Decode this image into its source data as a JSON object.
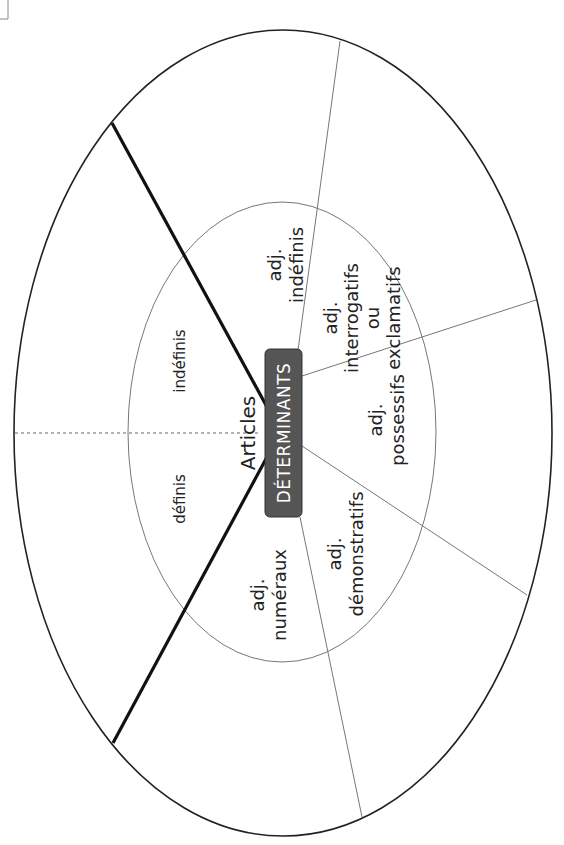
{
  "diagram": {
    "center": {
      "label": "DÉTERMINANTS",
      "fill": "#555555",
      "text_color": "#ffffff"
    },
    "articles": {
      "title": "Articles",
      "definis": "définis",
      "indefinis": "indéfinis"
    },
    "sectors": {
      "adj_indefinis": {
        "line1": "adj.",
        "line2": "indéfinis"
      },
      "adj_interrogatifs": {
        "line1": "adj.",
        "line2": "interrogatifs",
        "line3": "ou",
        "line4": "exclamatifs"
      },
      "adj_possessifs": {
        "line1": "adj.",
        "line2": "possessifs"
      },
      "adj_demonstratifs": {
        "line1": "adj.",
        "line2": "démonstratifs"
      },
      "adj_numeraux": {
        "line1": "adj.",
        "line2": "numéraux"
      }
    },
    "colors": {
      "stroke": "#222222",
      "thin_stroke": "#777777"
    }
  }
}
